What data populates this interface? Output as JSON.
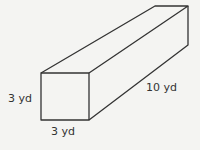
{
  "diagram": {
    "type": "rectangular prism",
    "labels": {
      "height": "3 yd",
      "width": "3 yd",
      "length": "10 yd"
    },
    "stroke_color": "#333333",
    "background": "#f4f4f2"
  }
}
